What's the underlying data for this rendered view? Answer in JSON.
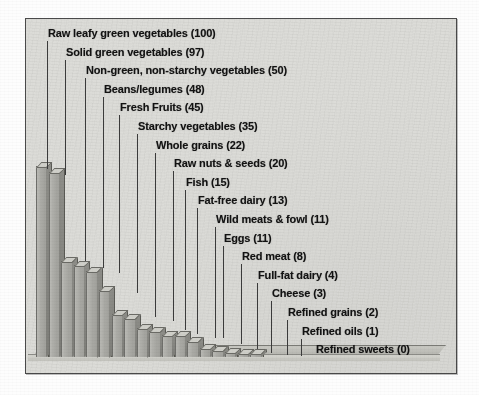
{
  "chart_data": {
    "type": "bar",
    "title": "",
    "subtitle": "",
    "xlabel": "",
    "ylabel": "",
    "ylim": [
      0,
      100
    ],
    "grid": false,
    "legend": "none",
    "style": "3d-bar-descending",
    "categories": [
      "Raw leafy green vegetables",
      "Solid green vegetables",
      "Non-green, non-starchy vegetables",
      "Beans/legumes",
      "Fresh Fruits",
      "Starchy vegetables",
      "Whole grains",
      "Raw nuts & seeds",
      "Fish",
      "Fat-free dairy",
      "Wild meats & fowl",
      "Eggs",
      "Red meat",
      "Full-fat dairy",
      "Cheese",
      "Refined grains",
      "Refined oils",
      "Refined sweets"
    ],
    "values": [
      100,
      97,
      50,
      48,
      45,
      35,
      22,
      20,
      15,
      13,
      11,
      11,
      8,
      4,
      3,
      2,
      1,
      0
    ],
    "labels": [
      "Raw leafy green vegetables (100)",
      "Solid green vegetables (97)",
      "Non-green, non-starchy vegetables (50)",
      "Beans/legumes (48)",
      "Fresh Fruits (45)",
      "Starchy vegetables (35)",
      "Whole grains (22)",
      "Raw nuts & seeds (20)",
      "Fish (15)",
      "Fat-free dairy (13)",
      "Wild meats & fowl (11)",
      "Eggs (11)",
      "Red meat (8)",
      "Full-fat dairy (4)",
      "Cheese (3)",
      "Refined grains (2)",
      "Refined oils (1)",
      "Refined sweets (0)"
    ]
  },
  "colors": {
    "frame_background": "#dcdcd8",
    "frame_border": "#4a4a4a",
    "bar_front": "#a9a9a4",
    "bar_top": "#cfcfc9",
    "bar_side": "#8d8d88",
    "label_text": "#131313",
    "leader_line": "#3b3b3b",
    "page_background": "#fdfdfd"
  }
}
